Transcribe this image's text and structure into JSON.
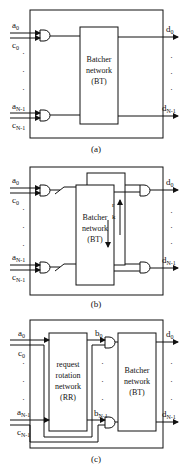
{
  "panels": [
    {
      "caption": "(a)",
      "inputs": {
        "a_top": "a",
        "a_top_sub": "0",
        "c_top": "c",
        "c_top_sub": "0",
        "a_bot": "a",
        "a_bot_sub": "N-1",
        "c_bot": "c",
        "c_bot_sub": "N-1"
      },
      "outputs": {
        "d_top": "d",
        "d_top_sub": "0",
        "d_bot": "d",
        "d_bot_sub": "N-1"
      },
      "box": {
        "line1": "Batcher",
        "line2": "network",
        "line3": "(BT)"
      }
    },
    {
      "caption": "(b)",
      "inputs": {
        "a_top": "a",
        "a_top_sub": "0",
        "c_top": "c",
        "c_top_sub": "0",
        "a_bot": "a",
        "a_bot_sub": "N-1",
        "c_bot": "c",
        "c_bot_sub": "N-1"
      },
      "outputs": {
        "d_top": "d",
        "d_top_sub": "0",
        "d_bot": "d",
        "d_bot_sub": "N-1"
      },
      "box": {
        "line1": "Batcher",
        "line2": "network",
        "line3": "(BT)"
      },
      "side_labels": [
        "r",
        "k"
      ]
    },
    {
      "caption": "(c)",
      "inputs": {
        "a_top": "a",
        "a_top_sub": "0",
        "c_top": "c",
        "c_top_sub": "0",
        "a_bot": "a",
        "a_bot_sub": "N-1",
        "c_bot": "c",
        "c_bot_sub": "N-1"
      },
      "outputs": {
        "d_top": "d",
        "d_top_sub": "0",
        "d_bot": "d",
        "d_bot_sub": "N-1"
      },
      "mid": {
        "b_top": "b",
        "b_top_sub": "0",
        "b_bot": "b",
        "b_bot_sub": "N-1"
      },
      "rr_box": {
        "line1": "request",
        "line2": "rotation",
        "line3": "network",
        "line4": "(RR)"
      },
      "box": {
        "line1": "Batcher",
        "line2": "network",
        "line3": "(BT)"
      }
    }
  ]
}
